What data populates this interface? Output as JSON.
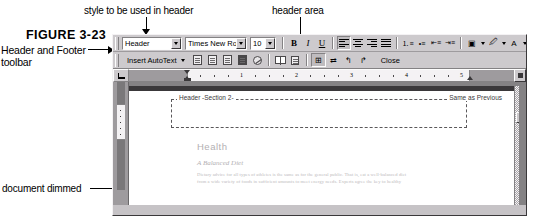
{
  "figure": {
    "number": "FIGURE 3-23",
    "callouts": {
      "toolbar": "Header and Footer toolbar",
      "style": "style to be used in header",
      "header_area": "header area",
      "document_dimmed": "document dimmed"
    }
  },
  "formatting_toolbar": {
    "style_value": "Header",
    "font_value": "Times New Roman",
    "size_value": "10",
    "bold_label": "B",
    "italic_label": "I",
    "underline_label": "U",
    "buttons": [
      "align-left",
      "align-center",
      "align-right",
      "align-justify",
      "numbered-list",
      "bulleted-list",
      "decrease-indent",
      "increase-indent",
      "borders",
      "highlight",
      "font-color"
    ]
  },
  "header_footer_toolbar": {
    "autotext_label": "Insert AutoText",
    "close_label": "Close",
    "buttons": [
      "insert-page-number",
      "insert-number-of-pages",
      "format-page-number",
      "insert-date",
      "insert-time",
      "page-setup",
      "show-hide-document-text",
      "same-as-previous",
      "switch-header-footer",
      "show-previous",
      "show-next"
    ]
  },
  "ruler": {
    "marks": [
      "1",
      "2",
      "3",
      "4",
      "5"
    ],
    "tab_selector_icon": "left-tab-stop-icon"
  },
  "document": {
    "header_label": "Header -Section 2-",
    "same_as_previous": "Same as Previous",
    "heading": "Health",
    "subheading": "A Balanced Diet",
    "body_lines": [
      "Dietary advice for all types of athletes is the same as for the general public. That is, eat a well-balanced diet",
      "from a wide variety of foods in sufficient amounts to meet energy needs. Experts agree the key to healthy"
    ]
  }
}
